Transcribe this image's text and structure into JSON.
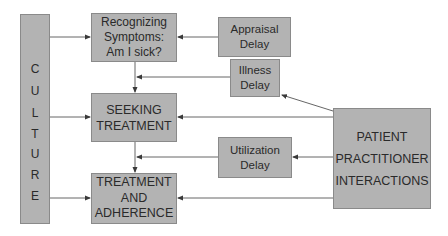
{
  "diagram": {
    "type": "flowchart",
    "culture": {
      "label": "CULTURE",
      "letters": [
        "C",
        "U",
        "L",
        "T",
        "U",
        "R",
        "E"
      ]
    },
    "stages": [
      {
        "id": "recognizing",
        "lines": [
          "Recognizing",
          "Symptoms:",
          "Am I sick?"
        ]
      },
      {
        "id": "seeking",
        "lines": [
          "SEEKING",
          "TREATMENT"
        ]
      },
      {
        "id": "treatment",
        "lines": [
          "TREATMENT",
          "AND",
          "ADHERENCE"
        ]
      }
    ],
    "delays": [
      {
        "id": "appraisal",
        "lines": [
          "Appraisal",
          "Delay"
        ]
      },
      {
        "id": "illness",
        "lines": [
          "Illness",
          "Delay"
        ]
      },
      {
        "id": "utilization",
        "lines": [
          "Utilization",
          "Delay"
        ]
      }
    ],
    "interactions": {
      "id": "patient-practitioner",
      "lines": [
        "PATIENT",
        "PRACTITIONER",
        "INTERACTIONS"
      ]
    },
    "edges": [
      {
        "from": "culture",
        "to": "recognizing"
      },
      {
        "from": "culture",
        "to": "seeking"
      },
      {
        "from": "culture",
        "to": "treatment"
      },
      {
        "from": "recognizing",
        "to": "seeking"
      },
      {
        "from": "seeking",
        "to": "treatment"
      },
      {
        "from": "appraisal",
        "to": "recognizing"
      },
      {
        "from": "illness",
        "to": "recognizing-seeking-link"
      },
      {
        "from": "utilization",
        "to": "seeking-treatment-link"
      },
      {
        "from": "patient-practitioner",
        "to": "illness"
      },
      {
        "from": "patient-practitioner",
        "to": "seeking"
      },
      {
        "from": "patient-practitioner",
        "to": "utilization"
      },
      {
        "from": "patient-practitioner",
        "to": "treatment"
      }
    ],
    "colors": {
      "box_fill": "#b3b3b3",
      "box_border": "#8a8a8a",
      "line": "#555555",
      "text": "#2a2a2a",
      "background": "#ffffff"
    }
  }
}
